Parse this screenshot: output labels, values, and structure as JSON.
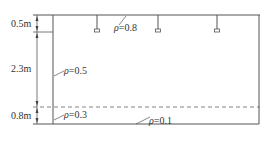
{
  "diagram": {
    "type": "room-section",
    "dimensions": [
      {
        "label": "0.5m",
        "value_m": 0.5,
        "region": "ceiling-cavity"
      },
      {
        "label": "2.3m",
        "value_m": 2.3,
        "region": "room-cavity"
      },
      {
        "label": "0.8m",
        "value_m": 0.8,
        "region": "floor-cavity"
      }
    ],
    "reflectances": [
      {
        "symbol": "ρ",
        "text": "=0.8",
        "value": 0.8,
        "surface": "ceiling"
      },
      {
        "symbol": "ρ",
        "text": "=0.5",
        "value": 0.5,
        "surface": "wall"
      },
      {
        "symbol": "ρ",
        "text": "=0.3",
        "value": 0.3,
        "surface": "lower-wall"
      },
      {
        "symbol": "ρ",
        "text": "=0.1",
        "value": 0.1,
        "surface": "floor"
      }
    ],
    "luminaires": {
      "count": 3,
      "icon": "pendant-lamp-icon"
    },
    "work_plane": {
      "style": "dashed"
    }
  },
  "colors": {
    "line": "#555555",
    "text": "#333333",
    "background": "#ffffff"
  }
}
